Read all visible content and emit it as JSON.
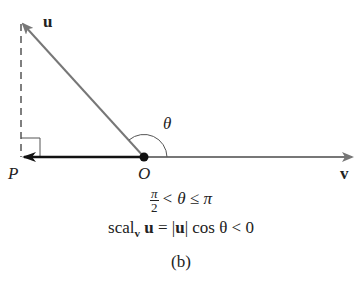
{
  "figure": {
    "labels": {
      "u": "u",
      "v": "v",
      "theta": "θ",
      "P": "P",
      "O": "O"
    },
    "condition": {
      "frac_num": "π",
      "frac_den": "2",
      "rest": "< θ ≤ π"
    },
    "formula": {
      "scal": "scal",
      "sub": "v",
      "u": "u",
      "middle": " = |",
      "u2": "u",
      "tail": "| cos θ < 0"
    },
    "caption": "(b)",
    "colors": {
      "vector": "#777777",
      "projection": "#111111",
      "dash": "#555555"
    }
  }
}
